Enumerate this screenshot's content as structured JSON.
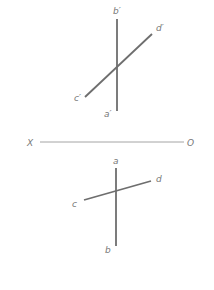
{
  "diagram": {
    "type": "orthographic-projection",
    "colors": {
      "line": "#6e6e6e",
      "axis": "#9a9a9a",
      "label": "#777777",
      "background": "#ffffff"
    },
    "axis": {
      "left_label": "X",
      "right_label": "O"
    },
    "front_view": {
      "line_ab": {
        "top_label": "b′",
        "bottom_label": "a′"
      },
      "line_cd": {
        "start_label": "c′",
        "end_label": "d′"
      }
    },
    "top_view": {
      "line_ab": {
        "top_label": "a",
        "bottom_label": "b"
      },
      "line_cd": {
        "start_label": "c",
        "end_label": "d"
      }
    }
  }
}
